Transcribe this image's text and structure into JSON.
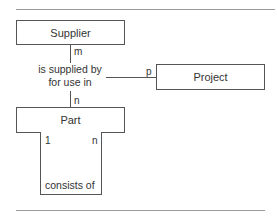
{
  "diagram": {
    "type": "entity-relationship",
    "entities": [
      {
        "id": "supplier",
        "label": "Supplier"
      },
      {
        "id": "project",
        "label": "Project"
      },
      {
        "id": "part",
        "label": "Part"
      }
    ],
    "relationships": [
      {
        "label_line1": "is supplied by",
        "label_line2": "for use in",
        "participants": [
          {
            "entity": "Supplier",
            "cardinality": "m"
          },
          {
            "entity": "Project",
            "cardinality": "p"
          },
          {
            "entity": "Part",
            "cardinality": "n"
          }
        ]
      },
      {
        "label": "consists of",
        "participants": [
          {
            "entity": "Part",
            "cardinality": "1"
          },
          {
            "entity": "Part",
            "cardinality": "n"
          }
        ]
      }
    ]
  },
  "colors": {
    "line": "#555555",
    "rule": "#9a9a9a",
    "text": "#333333",
    "background": "#ffffff"
  }
}
